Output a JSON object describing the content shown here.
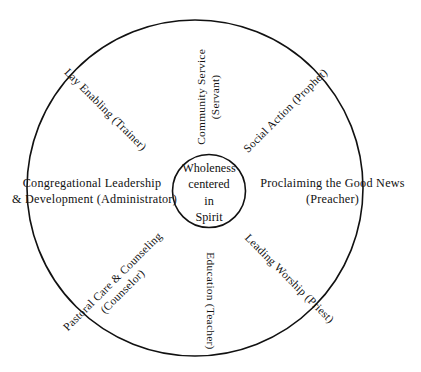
{
  "diagram": {
    "center": {
      "name": "center-circle",
      "lines": [
        "Wholeness",
        "centered",
        "in",
        "Spirit"
      ]
    },
    "geometry": {
      "outer_circle": {
        "cx": 195,
        "cy": 188,
        "r": 168
      },
      "inner_circle": {
        "cx": 209,
        "cy": 191,
        "r": 36
      },
      "stroke_color": "#111111"
    },
    "spokes": [
      {
        "name": "spoke-community-service",
        "position": "top",
        "angle_deg": -90,
        "line1": "Community Service",
        "line2": "(Servant)"
      },
      {
        "name": "spoke-social-action",
        "position": "top-right",
        "angle_deg": -45,
        "line1": "Social Action (Prophet)",
        "line2": ""
      },
      {
        "name": "spoke-proclaiming-good-news",
        "position": "right",
        "angle_deg": 0,
        "line1": "Proclaiming the Good News",
        "line2": "(Preacher)"
      },
      {
        "name": "spoke-leading-worship",
        "position": "bottom-right",
        "angle_deg": 45,
        "line1": "Leading Worship (Priest)",
        "line2": ""
      },
      {
        "name": "spoke-education",
        "position": "bottom",
        "angle_deg": 90,
        "line1": "Education (Teacher)",
        "line2": ""
      },
      {
        "name": "spoke-pastoral-care",
        "position": "bottom-left",
        "angle_deg": -45,
        "line1": "Pastoral Care & Counseling",
        "line2": "(Counselor)"
      },
      {
        "name": "spoke-congregational-leadership",
        "position": "left",
        "angle_deg": 0,
        "line1": "Congregational Leadership",
        "line2": "& Development (Administrator)"
      },
      {
        "name": "spoke-lay-enabling",
        "position": "top-left",
        "angle_deg": 45,
        "line1": "Lay Enabling (Trainer)",
        "line2": ""
      }
    ]
  }
}
